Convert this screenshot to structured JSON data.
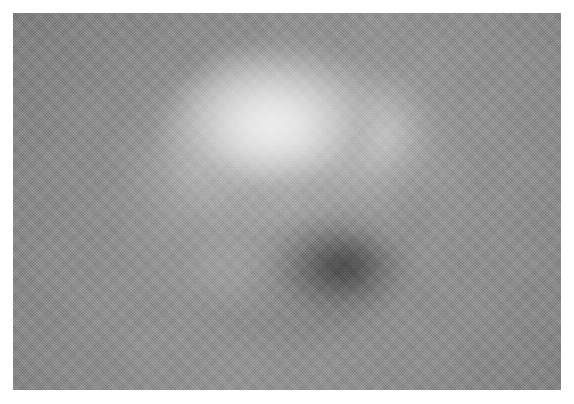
{
  "page": {
    "background_color": "#ffffff",
    "width": 574,
    "height": 404
  },
  "figure": {
    "caption": "",
    "alt_text": "Blurred grayscale halftone image of a roughly spherical object with a bright upper-left lobe and a dark lower-right lobe on a uniform mid-gray background"
  },
  "plate": {
    "name": "image-plate",
    "left": 13,
    "top": 13,
    "width": 548,
    "height": 377,
    "background_color": "#8a8a8a",
    "border": "none",
    "margin_color": "#ffffff"
  },
  "chart_data": {
    "type": "heatmap",
    "title": "",
    "subtitle": "",
    "xlabel": "",
    "ylabel": "",
    "grid": false,
    "legend": null,
    "colormap": "grayscale",
    "value_range": [
      58,
      239
    ],
    "background_level": 138,
    "features": [
      {
        "name": "background-field",
        "description": "uniform mid-gray field",
        "hex": "#8a8a8a",
        "level": 138
      },
      {
        "name": "bright-lobe",
        "description": "bright upper-left highlight lobe",
        "center_px": [
          268,
          115
        ],
        "radius_px": [
          118,
          96
        ],
        "peak_hex": "#efefef",
        "peak_level": 239
      },
      {
        "name": "bright-spill",
        "description": "light halo spilling to the upper right rim",
        "center_px": [
          400,
          160
        ],
        "radius_px": [
          82,
          76
        ],
        "peak_hex": "#d4d4d4",
        "peak_level": 212
      },
      {
        "name": "dark-lobe",
        "description": "dark lower-right shadow core",
        "center_px": [
          318,
          264
        ],
        "radius_px": [
          82,
          60
        ],
        "peak_hex": "#3a3a3a",
        "peak_level": 58
      },
      {
        "name": "shadow-skirt",
        "description": "broad shadow spreading down and left from the dark core",
        "center_px": [
          290,
          282
        ],
        "radius_px": [
          126,
          76
        ],
        "peak_hex": "#565656",
        "peak_level": 86
      },
      {
        "name": "terminator",
        "description": "soft transition band between bright and dark lobes",
        "center_px": [
          284,
          212
        ],
        "peak_hex": "#787878",
        "peak_level": 120
      },
      {
        "name": "object-disc",
        "description": "overall spherical object boundary",
        "center_px": [
          290,
          200
        ],
        "radius_px": [
          130,
          132
        ]
      }
    ]
  },
  "texture": {
    "name": "halftone-dither",
    "pattern": "checker",
    "screen_angle_deg": 45,
    "visible": true
  }
}
